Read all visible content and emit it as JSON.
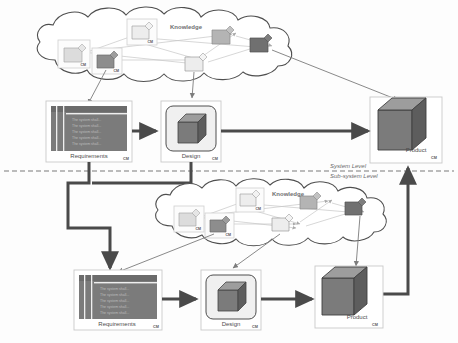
{
  "diagram": {
    "level_labels": {
      "system": "System Level",
      "subsystem": "Sub-system Level"
    },
    "cm_tag": "CM",
    "knowledge_label": "Knowledge",
    "colors": {
      "cube_front": "#7b7b7b",
      "cube_top": "#9d9d9d",
      "cube_side": "#5d5d5d",
      "doc_body": "#7b7b7b",
      "doc_header": "#6f6f6f",
      "arrow_thick": "#4a4a4a",
      "arrow_thin": "#7c7c7c",
      "cloud_stroke": "#4f4f4f",
      "box_stroke": "#c9c9c9",
      "divider": "#7a7a7a",
      "node_dark": "#6a6a6a",
      "node_mid": "#9a9a9a",
      "node_light": "#d8d8d8",
      "text": "#4d4d4d"
    },
    "system_level": {
      "requirements": {
        "label": "Requirements",
        "cm": "CM",
        "lines": [
          "The system shall...",
          "The system shall...",
          "The system shall...",
          "The system shall...",
          "The system shall..."
        ]
      },
      "design": {
        "label": "Design",
        "cm": "CM"
      },
      "product": {
        "label": "Product",
        "cm": "CM"
      },
      "knowledge": {
        "label": "Knowledge",
        "nodes": [
          {
            "id": "n1",
            "shade": "light",
            "cm": "CM",
            "boxed": true
          },
          {
            "id": "n2",
            "shade": "light",
            "cm": "CM",
            "boxed": true
          },
          {
            "id": "n3",
            "shade": "mid",
            "cm": "",
            "boxed": false
          },
          {
            "id": "n4",
            "shade": "dark",
            "cm": "",
            "boxed": false
          },
          {
            "id": "n5",
            "shade": "dark",
            "cm": "CM",
            "boxed": true
          },
          {
            "id": "n6",
            "shade": "light",
            "cm": "",
            "boxed": false
          }
        ]
      }
    },
    "subsystem_level": {
      "requirements": {
        "label": "Requirements",
        "cm": "CM",
        "lines": [
          "The system shall...",
          "The system shall...",
          "The system shall...",
          "The system shall...",
          "The system shall..."
        ]
      },
      "design": {
        "label": "Design",
        "cm": "CM"
      },
      "product": {
        "label": "Product",
        "cm": "CM"
      },
      "knowledge": {
        "label": "Knowledge",
        "nodes": [
          {
            "id": "m1",
            "shade": "light",
            "cm": "CM",
            "boxed": true
          },
          {
            "id": "m2",
            "shade": "light",
            "cm": "CM",
            "boxed": true
          },
          {
            "id": "m3",
            "shade": "mid",
            "cm": "",
            "boxed": false
          },
          {
            "id": "m4",
            "shade": "dark",
            "cm": "",
            "boxed": false
          },
          {
            "id": "m5",
            "shade": "dark",
            "cm": "CM",
            "boxed": true
          },
          {
            "id": "m6",
            "shade": "light",
            "cm": "",
            "boxed": false
          }
        ]
      }
    }
  }
}
